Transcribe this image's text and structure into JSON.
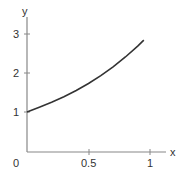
{
  "chart_data": {
    "type": "line",
    "title": "",
    "xlabel": "x",
    "ylabel": "y",
    "xlim": [
      0,
      1.1
    ],
    "ylim": [
      0,
      3.2
    ],
    "grid": false,
    "legend": null,
    "x_ticks": [
      {
        "value": 0,
        "label": "0"
      },
      {
        "value": 0.5,
        "label": "0.5"
      },
      {
        "value": 1,
        "label": "1"
      }
    ],
    "y_ticks": [
      {
        "value": 1,
        "label": "1"
      },
      {
        "value": 2,
        "label": "2"
      },
      {
        "value": 3,
        "label": "3"
      }
    ],
    "series": [
      {
        "name": "curve",
        "color": "#333333",
        "x": [
          0,
          0.1,
          0.2,
          0.3,
          0.4,
          0.5,
          0.6,
          0.7,
          0.8,
          0.9,
          0.95
        ],
        "y": [
          1.0,
          1.12,
          1.25,
          1.39,
          1.55,
          1.73,
          1.93,
          2.16,
          2.41,
          2.69,
          2.84
        ]
      }
    ]
  },
  "labels": {
    "x_axis": "x",
    "y_axis": "y",
    "origin": "0",
    "x_tick_half": "0.5",
    "x_tick_one": "1",
    "y_tick_one": "1",
    "y_tick_two": "2",
    "y_tick_three": "3"
  },
  "colors": {
    "axis": "#888888",
    "curve": "#333333",
    "text": "#333333"
  }
}
